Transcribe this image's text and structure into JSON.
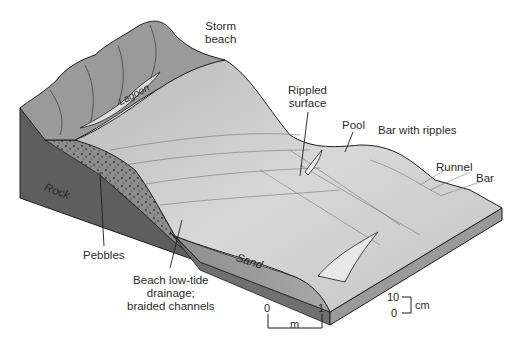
{
  "diagram": {
    "type": "block diagram",
    "colors": {
      "rock": "#5e5e5e",
      "pebbles": "#8a8a8a",
      "sand_side": "#9c9c9c",
      "surface": "#cfcfcf",
      "storm_beach": "#9a9a9a",
      "outline": "#1e1e1e",
      "text": "#2a2a2a"
    }
  },
  "labels": {
    "storm_beach": [
      "Storm",
      "beach"
    ],
    "lagoon": "Lagoon",
    "rippled_surface": [
      "Rippled",
      "surface"
    ],
    "pool": "Pool",
    "bar_with_ripples": "Bar with ripples",
    "runnel": "Runnel",
    "bar": "Bar",
    "rock": "Rock",
    "sand": "Sand",
    "pebbles": "Pebbles",
    "beach_drainage": [
      "Beach low-tide",
      "drainage;",
      "braided channels"
    ]
  },
  "scale_horizontal": {
    "start": "0",
    "end": "1",
    "unit": "m"
  },
  "scale_vertical": {
    "top": "10",
    "bottom": "0",
    "unit": "cm"
  }
}
